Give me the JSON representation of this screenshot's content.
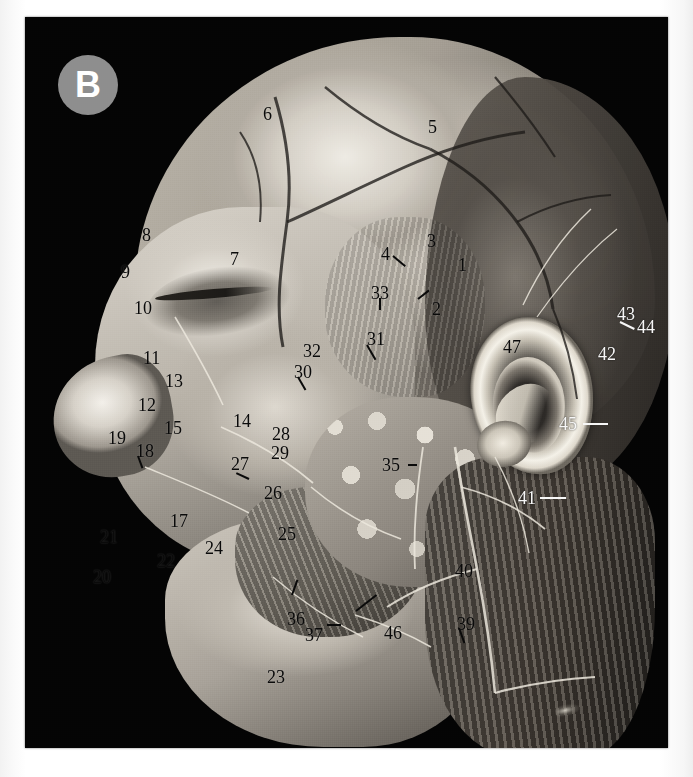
{
  "figure": {
    "panel_label": "B",
    "panel_badge_color": "#8e8e8e",
    "panel_text_color": "#ffffff",
    "plate_background": "#040404",
    "page_background": "#fdfdfd",
    "callout_dark_color": "#0a0a0a",
    "callout_light_color": "#f7f7f7"
  },
  "callouts": [
    {
      "n": "1",
      "x": 458,
      "y": 256,
      "tone": "dark",
      "leader": null
    },
    {
      "n": "2",
      "x": 432,
      "y": 300,
      "tone": "dark",
      "leader": {
        "type": "diag",
        "len": 14,
        "angle": -38,
        "dx": -14,
        "dy": -2
      }
    },
    {
      "n": "3",
      "x": 427,
      "y": 232,
      "tone": "dark",
      "leader": null
    },
    {
      "n": "4",
      "x": 381,
      "y": 245,
      "tone": "dark",
      "leader": {
        "type": "diag",
        "len": 16,
        "angle": 40,
        "dx": 12,
        "dy": 10
      }
    },
    {
      "n": "5",
      "x": 428,
      "y": 118,
      "tone": "dark",
      "leader": null
    },
    {
      "n": "6",
      "x": 263,
      "y": 105,
      "tone": "dark",
      "leader": null
    },
    {
      "n": "7",
      "x": 230,
      "y": 250,
      "tone": "dark",
      "leader": null
    },
    {
      "n": "8",
      "x": 142,
      "y": 226,
      "tone": "dark",
      "leader": null
    },
    {
      "n": "9",
      "x": 121,
      "y": 263,
      "tone": "dark",
      "leader": null
    },
    {
      "n": "10",
      "x": 134,
      "y": 299,
      "tone": "dark",
      "leader": null
    },
    {
      "n": "11",
      "x": 143,
      "y": 349,
      "tone": "dark",
      "leader": null
    },
    {
      "n": "12",
      "x": 138,
      "y": 396,
      "tone": "dark",
      "leader": null
    },
    {
      "n": "13",
      "x": 165,
      "y": 372,
      "tone": "dark",
      "leader": null
    },
    {
      "n": "14",
      "x": 233,
      "y": 412,
      "tone": "dark",
      "leader": null
    },
    {
      "n": "15",
      "x": 164,
      "y": 419,
      "tone": "dark",
      "leader": null
    },
    {
      "n": "17",
      "x": 170,
      "y": 512,
      "tone": "dark",
      "leader": null
    },
    {
      "n": "18",
      "x": 136,
      "y": 442,
      "tone": "dark",
      "leader": {
        "type": "diag",
        "len": 13,
        "angle": 70,
        "dx": 2,
        "dy": 13
      }
    },
    {
      "n": "19",
      "x": 108,
      "y": 429,
      "tone": "dark",
      "leader": null
    },
    {
      "n": "20",
      "x": 93,
      "y": 568,
      "tone": "dark",
      "leader": null
    },
    {
      "n": "21",
      "x": 100,
      "y": 528,
      "tone": "dark",
      "leader": null
    },
    {
      "n": "22",
      "x": 157,
      "y": 552,
      "tone": "dark",
      "leader": null
    },
    {
      "n": "23",
      "x": 267,
      "y": 668,
      "tone": "dark",
      "leader": null
    },
    {
      "n": "24",
      "x": 205,
      "y": 539,
      "tone": "dark",
      "leader": null
    },
    {
      "n": "25",
      "x": 278,
      "y": 525,
      "tone": "dark",
      "leader": null
    },
    {
      "n": "26",
      "x": 264,
      "y": 484,
      "tone": "dark",
      "leader": {
        "type": "diag",
        "len": 14,
        "angle": -155,
        "dx": -15,
        "dy": -6
      }
    },
    {
      "n": "27",
      "x": 231,
      "y": 455,
      "tone": "dark",
      "leader": null
    },
    {
      "n": "28",
      "x": 272,
      "y": 425,
      "tone": "dark",
      "leader": null
    },
    {
      "n": "29",
      "x": 271,
      "y": 444,
      "tone": "dark",
      "leader": null
    },
    {
      "n": "30",
      "x": 294,
      "y": 363,
      "tone": "dark",
      "leader": {
        "type": "diag",
        "len": 15,
        "angle": 60,
        "dx": 4,
        "dy": 13
      }
    },
    {
      "n": "31",
      "x": 367,
      "y": 330,
      "tone": "dark",
      "leader": {
        "type": "diag",
        "len": 17,
        "angle": 60,
        "dx": 0,
        "dy": 14
      }
    },
    {
      "n": "32",
      "x": 303,
      "y": 342,
      "tone": "dark",
      "leader": null
    },
    {
      "n": "33",
      "x": 371,
      "y": 284,
      "tone": "dark",
      "leader": {
        "type": "vert",
        "len": 12,
        "dx": 8,
        "dy": 14
      }
    },
    {
      "n": "35",
      "x": 382,
      "y": 456,
      "tone": "dark",
      "leader": {
        "type": "horz",
        "len": 9,
        "dx": 26,
        "dy": 8
      }
    },
    {
      "n": "36",
      "x": 287,
      "y": 610,
      "tone": "dark",
      "leader": {
        "type": "diag",
        "len": 16,
        "angle": -70,
        "dx": 5,
        "dy": -16
      }
    },
    {
      "n": "37",
      "x": 305,
      "y": 626,
      "tone": "dark",
      "leader": {
        "type": "horz",
        "len": 14,
        "dx": 22,
        "dy": -2
      }
    },
    {
      "n": "39",
      "x": 457,
      "y": 615,
      "tone": "dark",
      "leader": {
        "type": "diag",
        "len": 16,
        "angle": 70,
        "dx": 2,
        "dy": 12
      }
    },
    {
      "n": "40",
      "x": 455,
      "y": 562,
      "tone": "dark",
      "leader": null
    },
    {
      "n": "41",
      "x": 518,
      "y": 489,
      "tone": "light",
      "leader": {
        "type": "horz",
        "len": 26,
        "dx": 22,
        "dy": 8
      }
    },
    {
      "n": "42",
      "x": 598,
      "y": 345,
      "tone": "light",
      "leader": null
    },
    {
      "n": "43",
      "x": 617,
      "y": 305,
      "tone": "light",
      "leader": {
        "type": "diag",
        "len": 16,
        "angle": 26,
        "dx": 3,
        "dy": 16
      }
    },
    {
      "n": "44",
      "x": 637,
      "y": 318,
      "tone": "light",
      "leader": null
    },
    {
      "n": "45",
      "x": 559,
      "y": 415,
      "tone": "light",
      "leader": {
        "type": "horz",
        "len": 25,
        "dx": 24,
        "dy": 8
      }
    },
    {
      "n": "46",
      "x": 384,
      "y": 624,
      "tone": "dark",
      "leader": {
        "type": "diag",
        "len": 26,
        "angle": -38,
        "dx": -28,
        "dy": -14
      }
    },
    {
      "n": "47",
      "x": 503,
      "y": 338,
      "tone": "dark",
      "leader": null
    }
  ]
}
